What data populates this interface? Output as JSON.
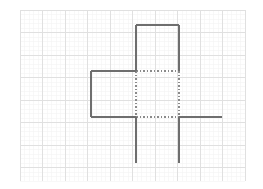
{
  "page": {
    "width": 263,
    "height": 189,
    "background_color": "#ffffff"
  },
  "grid": {
    "name": "graph-paper-grid",
    "origin_x": 20,
    "origin_y": 10,
    "end_x": 245,
    "end_y": 181,
    "cell_size": 22.5,
    "columns": 10,
    "rows": 8,
    "minor_color": "#ebebeb",
    "major_color": "#e0e0e0",
    "minor_width": 0.6,
    "major_width": 1.0,
    "minor_divisions": 5,
    "minor_color_faint": "#f4f4f4"
  },
  "figure": {
    "name": "box-net-figure",
    "solid_color": "#6e6e6e",
    "dotted_color": "#8a8a8a",
    "solid_width": 1.6,
    "dotted_width": 1.3,
    "dash_pattern": "1.6 1.9",
    "vertices": {
      "top_square_left_x": 136,
      "top_square_right_x": 179,
      "top_square_top_y": 25,
      "top_square_bottom_y": 71,
      "left_square_left_x": 91,
      "middle_row_top_y": 71,
      "middle_row_bottom_y": 117,
      "right_tab_end_x": 222,
      "bottom_legs_end_y": 163
    },
    "solid_segments": [
      {
        "name": "top-square-top-edge",
        "x1": 136,
        "y1": 25,
        "x2": 179,
        "y2": 25
      },
      {
        "name": "top-square-left-edge",
        "x1": 136,
        "y1": 25,
        "x2": 136,
        "y2": 71
      },
      {
        "name": "top-square-right-edge",
        "x1": 179,
        "y1": 25,
        "x2": 179,
        "y2": 71
      },
      {
        "name": "left-square-top-edge",
        "x1": 91,
        "y1": 71,
        "x2": 136,
        "y2": 71
      },
      {
        "name": "left-square-left-edge",
        "x1": 91,
        "y1": 71,
        "x2": 91,
        "y2": 117
      },
      {
        "name": "left-square-bottom-edge",
        "x1": 91,
        "y1": 117,
        "x2": 136,
        "y2": 117
      },
      {
        "name": "right-tab-edge",
        "x1": 179,
        "y1": 117,
        "x2": 222,
        "y2": 117
      },
      {
        "name": "left-leg-edge",
        "x1": 136,
        "y1": 117,
        "x2": 136,
        "y2": 163
      },
      {
        "name": "right-leg-edge",
        "x1": 179,
        "y1": 117,
        "x2": 179,
        "y2": 163
      }
    ],
    "dotted_segments": [
      {
        "name": "center-square-top-hidden-edge",
        "x1": 136,
        "y1": 71,
        "x2": 179,
        "y2": 71
      },
      {
        "name": "center-square-left-hidden-edge",
        "x1": 136,
        "y1": 71,
        "x2": 136,
        "y2": 117
      },
      {
        "name": "center-square-right-hidden-edge",
        "x1": 179,
        "y1": 71,
        "x2": 179,
        "y2": 117
      },
      {
        "name": "center-square-bottom-hidden-edge",
        "x1": 136,
        "y1": 117,
        "x2": 179,
        "y2": 117
      }
    ]
  }
}
